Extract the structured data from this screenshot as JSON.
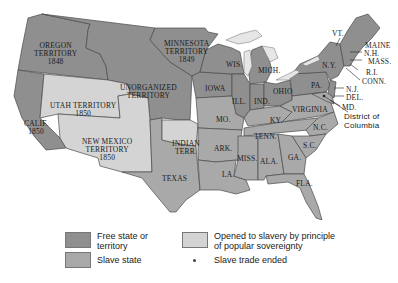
{
  "colors": {
    "free": "#8f8f8f",
    "slave": "#a9a9a9",
    "popular_sovereignty": "#d4d4d4",
    "water": "#e6e6e6",
    "border": "#4a4a4a"
  },
  "map": {
    "labels": {
      "oregon": "OREGON\nTERRITORY\n1848",
      "minnesota": "MINNESOTA\nTERRITORY\n1849",
      "unorganized": "UNORGANIZED\nTERRITORY",
      "utah": "UTAH TERRITORY\n1850",
      "calif": "CALIF.\n1850",
      "new_mexico": "NEW MEXICO\nTERRITORY\n1850",
      "indian": "INDIAN\nTERR.",
      "texas": "TEXAS",
      "iowa": "IOWA",
      "wis": "WIS.",
      "mich": "MICH.",
      "ill": "ILL.",
      "ind": "IND.",
      "ohio": "OHIO",
      "mo": "MO.",
      "ky": "KY.",
      "tenn": "TENN.",
      "ark": "ARK.",
      "la": "LA.",
      "miss": "MISS.",
      "ala": "ALA.",
      "ga": "GA.",
      "fla": "FLA.",
      "sc": "S.C.",
      "nc": "N.C.",
      "virginia": "VIRGINIA",
      "pa": "PA.",
      "ny": "N.Y.",
      "vt": "VT.",
      "maine": "MAINE",
      "nh": "N.H.",
      "mass": "MASS.",
      "ri": "R.I.",
      "conn": "CONN.",
      "nj": "N.J.",
      "del": "DEL.",
      "md": "MD.",
      "dc": "District of\nColumbia"
    }
  },
  "legend": {
    "items": [
      {
        "label": "Free state or\nterritory",
        "type": "free"
      },
      {
        "label": "Slave state",
        "type": "slave"
      },
      {
        "label": "Opened to slavery by principle\nof popular sovereignty",
        "type": "popular_sovereignty"
      },
      {
        "label": "Slave trade ended",
        "type": "dot"
      }
    ]
  }
}
